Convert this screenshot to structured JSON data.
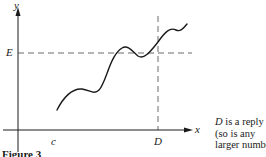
{
  "figure": {
    "caption": "Figure 3",
    "axes": {
      "x_label": "x",
      "y_label": "y"
    },
    "markers": {
      "E_label": "E",
      "c_label": "c",
      "D_label": "D"
    },
    "note": {
      "line1_var": "D",
      "line1_rest": " is a reply",
      "line2": "(so is any",
      "line3": "larger number)."
    }
  }
}
